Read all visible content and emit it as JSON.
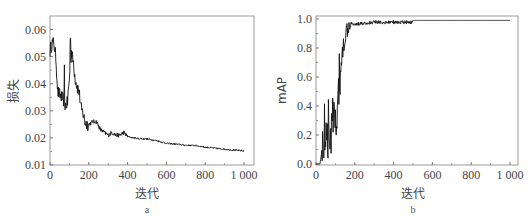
{
  "chart_data": [
    {
      "id": "a",
      "type": "line",
      "title": "",
      "sub_label": "a",
      "xlabel": "迭代",
      "ylabel": "损失",
      "xlim": [
        0,
        1000
      ],
      "ylim": [
        0.01,
        0.065
      ],
      "x_ticks": [
        0,
        200,
        400,
        600,
        800,
        1000
      ],
      "x_tick_labels": [
        "0",
        "200",
        "400",
        "600",
        "800",
        "1 000"
      ],
      "y_ticks": [
        0.01,
        0.02,
        0.03,
        0.04,
        0.05,
        0.06
      ],
      "y_tick_labels": [
        "0.01",
        "0.02",
        "0.03",
        "0.04",
        "0.05",
        "0.06"
      ],
      "grid": false,
      "legend": null,
      "series": [
        {
          "name": "损失",
          "x": [
            0,
            10,
            20,
            30,
            40,
            50,
            60,
            70,
            80,
            90,
            100,
            110,
            120,
            130,
            140,
            150,
            160,
            170,
            180,
            190,
            200,
            220,
            240,
            260,
            280,
            300,
            320,
            340,
            360,
            380,
            400,
            450,
            500,
            550,
            600,
            650,
            700,
            750,
            800,
            850,
            900,
            950,
            1000
          ],
          "y": [
            0.052,
            0.055,
            0.055,
            0.05,
            0.037,
            0.036,
            0.035,
            0.034,
            0.032,
            0.033,
            0.042,
            0.052,
            0.048,
            0.042,
            0.039,
            0.037,
            0.031,
            0.029,
            0.026,
            0.025,
            0.025,
            0.026,
            0.026,
            0.023,
            0.022,
            0.021,
            0.022,
            0.021,
            0.021,
            0.022,
            0.0205,
            0.0198,
            0.0196,
            0.019,
            0.018,
            0.0177,
            0.0173,
            0.0172,
            0.0166,
            0.0162,
            0.0158,
            0.0155,
            0.0152
          ]
        }
      ],
      "annotations": [
        "spike to ~0.059 near iteration 105",
        "spike to ~0.047 near iteration 75"
      ]
    },
    {
      "id": "b",
      "type": "line",
      "title": "",
      "sub_label": "b",
      "xlabel": "迭代",
      "ylabel": "mAP",
      "xlim": [
        0,
        1000
      ],
      "ylim": [
        0.0,
        1.0
      ],
      "x_ticks": [
        0,
        200,
        400,
        600,
        800,
        1000
      ],
      "x_tick_labels": [
        "0",
        "200",
        "400",
        "600",
        "800",
        "1 000"
      ],
      "y_ticks": [
        0.0,
        0.2,
        0.4,
        0.6,
        0.8,
        1.0
      ],
      "y_tick_labels": [
        "0.0",
        "0.2",
        "0.4",
        "0.6",
        "0.8",
        "1.0"
      ],
      "grid": false,
      "legend": null,
      "series": [
        {
          "name": "mAP",
          "x": [
            0,
            20,
            30,
            40,
            50,
            60,
            70,
            80,
            90,
            100,
            110,
            120,
            130,
            140,
            150,
            160,
            170,
            180,
            200,
            220,
            250,
            300,
            400,
            500,
            600,
            700,
            800,
            900,
            1000
          ],
          "y": [
            0.0,
            0.0,
            0.08,
            0.15,
            0.3,
            0.2,
            0.25,
            0.2,
            0.3,
            0.22,
            0.35,
            0.55,
            0.7,
            0.8,
            0.88,
            0.93,
            0.97,
            0.98,
            0.97,
            0.98,
            0.98,
            0.99,
            0.99,
            0.99,
            0.99,
            0.99,
            0.99,
            0.99,
            0.99
          ]
        }
      ],
      "annotations": [
        "high oscillation between 0.05 and 0.55 for iterations 30-120"
      ]
    }
  ]
}
